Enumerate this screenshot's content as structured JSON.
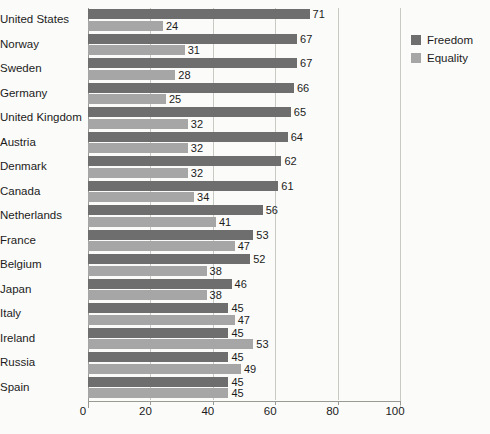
{
  "chart_data": {
    "type": "bar",
    "orientation": "horizontal",
    "title": "",
    "subtitle": "",
    "xlabel": "",
    "ylabel": "",
    "xlim": [
      0,
      100
    ],
    "xticks": [
      0,
      20,
      40,
      60,
      80,
      100
    ],
    "grid": true,
    "grid_axis": "x",
    "legend_position": "right",
    "categories": [
      "United States",
      "Norway",
      "Sweden",
      "Germany",
      "United Kingdom",
      "Austria",
      "Denmark",
      "Canada",
      "Netherlands",
      "France",
      "Belgium",
      "Japan",
      "Italy",
      "Ireland",
      "Russia",
      "Spain"
    ],
    "series": [
      {
        "name": "Freedom",
        "color": "#6e6e6e",
        "values": [
          71,
          67,
          67,
          66,
          65,
          64,
          62,
          61,
          56,
          53,
          52,
          46,
          45,
          45,
          45,
          45
        ]
      },
      {
        "name": "Equality",
        "color": "#a6a6a6",
        "values": [
          24,
          31,
          28,
          25,
          32,
          32,
          32,
          34,
          41,
          47,
          38,
          38,
          47,
          53,
          49,
          45
        ]
      }
    ]
  },
  "legend": {
    "items": [
      {
        "label": "Freedom",
        "color": "#6e6e6e"
      },
      {
        "label": "Equality",
        "color": "#a6a6a6"
      }
    ]
  },
  "colors": {
    "background": "#fbfbf9",
    "freedom": "#6e6e6e",
    "equality": "#a6a6a6",
    "axis": "#9a9a95",
    "gridline": "#c9c9c4",
    "text": "#1c1c1c"
  }
}
